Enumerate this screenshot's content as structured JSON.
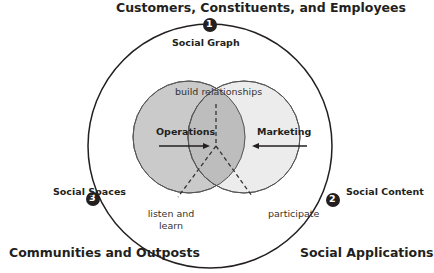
{
  "titles": {
    "top": "Customers, Constituents, and Employees",
    "bottom_left": "Communities and Outposts",
    "bottom_right": "Social Applications"
  },
  "markers": [
    {
      "number": "1",
      "label": "Social Graph"
    },
    {
      "number": "2",
      "label": "Social Content"
    },
    {
      "number": "3",
      "label": "Social Spaces"
    }
  ],
  "venn": {
    "left": "Operations",
    "right": "Marketing"
  },
  "annotations": {
    "top": "build relationships",
    "left_line1": "listen and",
    "left_line2": "learn",
    "right": "participate"
  },
  "colors": {
    "left_fill": "#c9c9c9",
    "right_fill": "#e4e4e4",
    "overlap_fill": "#bdbdbd",
    "stroke": "#231f20"
  }
}
